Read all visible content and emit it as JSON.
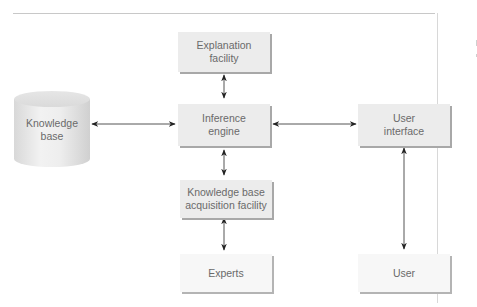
{
  "diagram": {
    "nodes": {
      "explanation_facility": {
        "line1": "Explanation",
        "line2": "facility"
      },
      "knowledge_base": {
        "line1": "Knowledge",
        "line2": "base",
        "shape": "cylinder"
      },
      "inference_engine": {
        "line1": "Inference",
        "line2": "engine"
      },
      "user_interface": {
        "line1": "User",
        "line2": "interface"
      },
      "kb_acquisition_facility": {
        "line1": "Knowledge base",
        "line2": "acquisition facility"
      },
      "experts": {
        "label": "Experts"
      },
      "user": {
        "label": "User"
      }
    },
    "edges": [
      {
        "from": "explanation_facility",
        "to": "inference_engine",
        "type": "bidirectional"
      },
      {
        "from": "knowledge_base",
        "to": "inference_engine",
        "type": "bidirectional"
      },
      {
        "from": "inference_engine",
        "to": "user_interface",
        "type": "bidirectional"
      },
      {
        "from": "inference_engine",
        "to": "kb_acquisition_facility",
        "type": "bidirectional"
      },
      {
        "from": "kb_acquisition_facility",
        "to": "experts",
        "type": "bidirectional"
      },
      {
        "from": "user_interface",
        "to": "user",
        "type": "bidirectional"
      }
    ],
    "colors": {
      "box_fill": "#ececec",
      "box_shadow": "#a8a8a8",
      "light_box_fill": "#f7f7f7",
      "text": "#6a6a6a",
      "arrow": "#222222"
    }
  }
}
